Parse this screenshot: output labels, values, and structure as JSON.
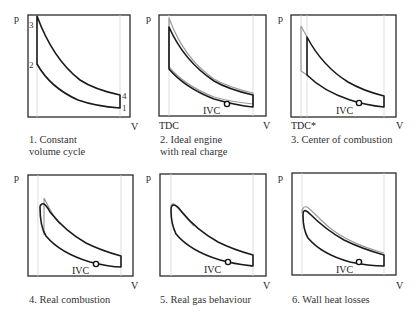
{
  "diagram": {
    "axis_labels": {
      "y": "p",
      "x": "V"
    },
    "panels": [
      {
        "id": 1,
        "caption_line1": "1. Constant",
        "caption_line2": "volume cycle",
        "point_labels": [
          "1",
          "2",
          "3",
          "4"
        ],
        "tdc_label": "",
        "ivc_label": ""
      },
      {
        "id": 2,
        "caption_line1": "2. Ideal engine",
        "caption_line2": "with real charge",
        "tdc_label": "TDC",
        "ivc_label": "IVC"
      },
      {
        "id": 3,
        "caption_line1": "3. Center of combustion",
        "caption_line2": "",
        "tdc_label": "TDC*",
        "ivc_label": "IVC"
      },
      {
        "id": 4,
        "caption_line1": "4. Real combustion",
        "caption_line2": "",
        "tdc_label": "",
        "ivc_label": "IVC"
      },
      {
        "id": 5,
        "caption_line1": "5. Real gas behaviour",
        "caption_line2": "",
        "tdc_label": "",
        "ivc_label": "IVC"
      },
      {
        "id": 6,
        "caption_line1": "6. Wall heat losses",
        "caption_line2": "",
        "tdc_label": "",
        "ivc_label": "IVC"
      }
    ],
    "colors": {
      "frame": "#2a2a2a",
      "curve": "#1a1a1a",
      "previous_curve": "#9a9a9a",
      "guide": "#d4d4d4"
    }
  }
}
